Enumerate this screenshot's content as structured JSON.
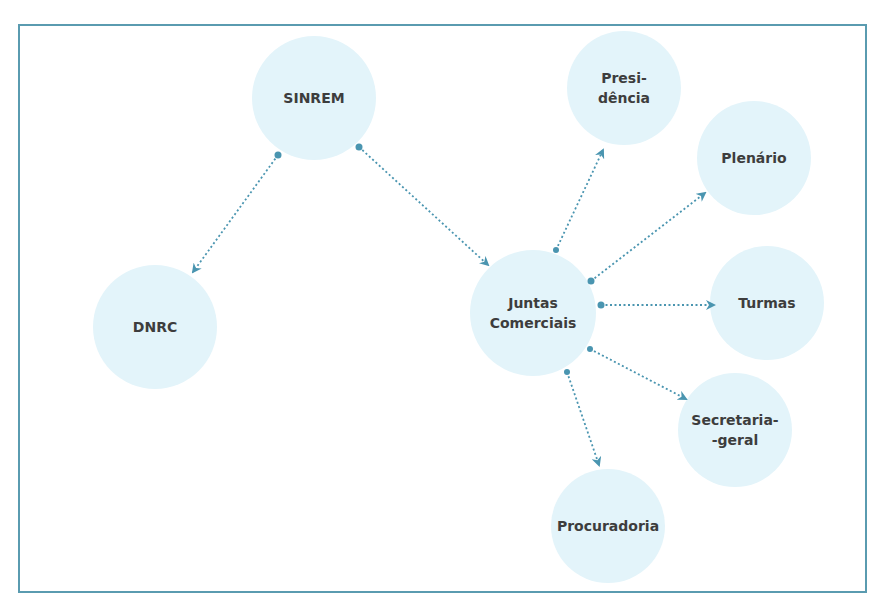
{
  "diagram": {
    "type": "organizational-relationship-diagram",
    "colors": {
      "frame_border": "#5a9bb0",
      "node_fill": "#e3f4fa",
      "connector": "#4a95b0",
      "label_text": "#3d3d3d"
    },
    "nodes": {
      "sinrem": {
        "label": "SINREM"
      },
      "dnrc": {
        "label": "DNRC"
      },
      "juntas": {
        "label": "Juntas\nComerciais"
      },
      "presidencia": {
        "label": "Presi-\ndência"
      },
      "plenario": {
        "label": "Plenário"
      },
      "turmas": {
        "label": "Turmas"
      },
      "secretaria": {
        "label": "Secretaria-\n-geral"
      },
      "procuradoria": {
        "label": "Procuradoria"
      }
    },
    "edges": [
      {
        "from": "SINREM",
        "to": "DNRC",
        "style": "dotted-arrow"
      },
      {
        "from": "SINREM",
        "to": "Juntas Comerciais",
        "style": "dotted-arrow"
      },
      {
        "from": "Juntas Comerciais",
        "to": "Presidência",
        "style": "dotted-arrow"
      },
      {
        "from": "Juntas Comerciais",
        "to": "Plenário",
        "style": "dotted-arrow"
      },
      {
        "from": "Juntas Comerciais",
        "to": "Turmas",
        "style": "dotted-arrow"
      },
      {
        "from": "Juntas Comerciais",
        "to": "Secretaria-geral",
        "style": "dotted-arrow"
      },
      {
        "from": "Juntas Comerciais",
        "to": "Procuradoria",
        "style": "dotted-arrow"
      }
    ]
  }
}
